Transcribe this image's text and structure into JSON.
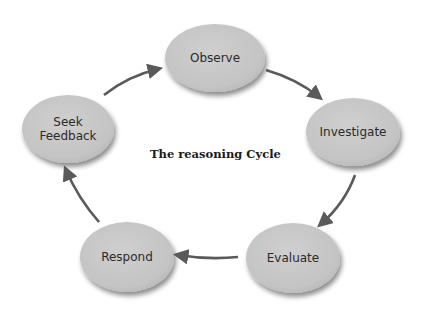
{
  "diagram": {
    "title": "The reasoning Cycle",
    "colors": {
      "node_fill": "#c7c7c7",
      "node_shadow": "#9a9a9a",
      "arrow": "#5a5a5a",
      "text": "#2a2a2a",
      "background": "#ffffff"
    },
    "nodes": [
      {
        "id": "observe",
        "label": "Observe"
      },
      {
        "id": "investigate",
        "label": "Investigate"
      },
      {
        "id": "evaluate",
        "label": "Evaluate"
      },
      {
        "id": "respond",
        "label": "Respond"
      },
      {
        "id": "seek_feedback",
        "label_line1": "Seek",
        "label_line2": "Feedback"
      }
    ],
    "edges": [
      {
        "from": "observe",
        "to": "investigate"
      },
      {
        "from": "investigate",
        "to": "evaluate"
      },
      {
        "from": "evaluate",
        "to": "respond"
      },
      {
        "from": "respond",
        "to": "seek_feedback"
      },
      {
        "from": "seek_feedback",
        "to": "observe"
      }
    ]
  }
}
